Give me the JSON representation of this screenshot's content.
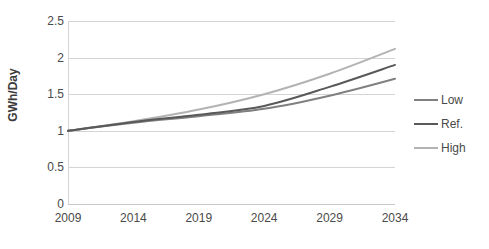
{
  "chart_data": {
    "type": "line",
    "title": "",
    "xlabel": "",
    "ylabel": "GWh/Day",
    "x": [
      2009,
      2014,
      2019,
      2024,
      2029,
      2034
    ],
    "categories": [
      "2009",
      "2014",
      "2019",
      "2024",
      "2029",
      "2034"
    ],
    "xlim": [
      2009,
      2034
    ],
    "ylim": [
      0,
      2.5
    ],
    "yticks": [
      "0",
      "0.5",
      "1",
      "1.5",
      "2",
      "2.5"
    ],
    "ytick_values": [
      0,
      0.5,
      1,
      1.5,
      2,
      2.5
    ],
    "grid": "horizontal",
    "legend_position": "right",
    "series": [
      {
        "name": "Low",
        "color": "#808080",
        "values": [
          1.0,
          1.11,
          1.2,
          1.3,
          1.48,
          1.71
        ]
      },
      {
        "name": "Ref.",
        "color": "#595959",
        "values": [
          1.0,
          1.12,
          1.22,
          1.34,
          1.6,
          1.9
        ]
      },
      {
        "name": "High",
        "color": "#b3b3b3",
        "values": [
          1.0,
          1.13,
          1.29,
          1.5,
          1.78,
          2.12
        ]
      }
    ]
  },
  "legend": {
    "items": [
      {
        "label": "Low"
      },
      {
        "label": "Ref."
      },
      {
        "label": "High"
      }
    ]
  },
  "colors": {
    "gridline": "#d4d4d4",
    "axis": "#c9c9c9",
    "text": "#4a4a4a",
    "title_text": "#3b3b3b",
    "background": "#ffffff"
  }
}
